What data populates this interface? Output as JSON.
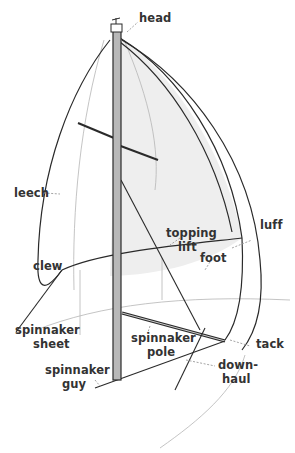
{
  "diagram": {
    "colors": {
      "line": "#2a2a2a",
      "mast_fill": "#b8b8b8",
      "sail_shade": "#eeeeee",
      "label": "#333333",
      "leader": "#9a9a9a"
    },
    "labels": {
      "head": "head",
      "leech": "leech",
      "topping_lift_1": "topping",
      "topping_lift_2": "lift",
      "luff": "luff",
      "foot": "foot",
      "clew": "clew",
      "spinnaker_sheet_1": "spinnaker",
      "spinnaker_sheet_2": "sheet",
      "spinnaker_pole_1": "spinnaker",
      "spinnaker_pole_2": "pole",
      "tack": "tack",
      "spinnaker_guy_1": "spinnaker",
      "spinnaker_guy_2": "guy",
      "downhaul_1": "down-",
      "downhaul_2": "haul"
    }
  }
}
